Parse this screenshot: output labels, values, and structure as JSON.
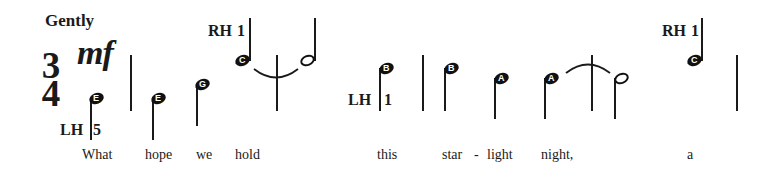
{
  "title": "Gently",
  "time_signature": {
    "top": "3",
    "bottom": "4"
  },
  "dynamic": "mf",
  "colors": {
    "ink": "#1a1a1a",
    "background": "#ffffff",
    "note_letter": "#ffffff"
  },
  "fingerings": [
    {
      "label": "LH",
      "finger": "5"
    },
    {
      "label": "RH",
      "finger": "1"
    },
    {
      "label": "LH",
      "finger": "1"
    },
    {
      "label": "RH",
      "finger": "1"
    }
  ],
  "notes": [
    {
      "letter": "E",
      "type": "quarter",
      "stem": "up"
    },
    {
      "letter": "E",
      "type": "quarter",
      "stem": "up"
    },
    {
      "letter": "G",
      "type": "quarter",
      "stem": "up"
    },
    {
      "letter": "C",
      "type": "quarter",
      "stem": "up",
      "tied": true
    },
    {
      "letter": "",
      "type": "half",
      "stem": "up"
    },
    {
      "letter": "B",
      "type": "quarter",
      "stem": "up"
    },
    {
      "letter": "B",
      "type": "quarter",
      "stem": "up"
    },
    {
      "letter": "A",
      "type": "quarter",
      "stem": "up"
    },
    {
      "letter": "A",
      "type": "quarter",
      "stem": "up",
      "tied": true
    },
    {
      "letter": "",
      "type": "half",
      "stem": "up"
    },
    {
      "letter": "C",
      "type": "quarter",
      "stem": "up"
    }
  ],
  "lyrics": [
    "What",
    "hope",
    "we",
    "hold",
    "this",
    "star",
    "-",
    "light",
    "night,",
    "a"
  ]
}
